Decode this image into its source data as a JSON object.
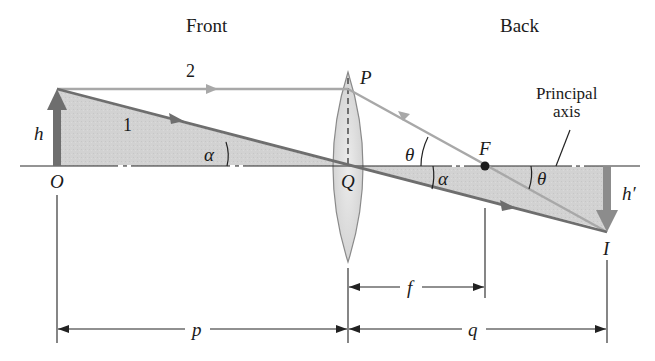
{
  "diagram": {
    "type": "thin converging lens ray diagram",
    "headers": {
      "front": "Front",
      "back": "Back"
    },
    "rays": [
      {
        "id": "1",
        "label": "1",
        "description": "Ray from object tip through lens center Q to image I"
      },
      {
        "id": "2",
        "label": "2",
        "description": "Ray parallel to axis to P, refracted through focal point F to I"
      }
    ],
    "points": {
      "object": "O",
      "lens_top": "P",
      "lens_center": "Q",
      "focal_point": "F",
      "image": "I"
    },
    "heights": {
      "object": "h",
      "image": "h′"
    },
    "angles": {
      "alpha": "α",
      "theta": "θ"
    },
    "annotation": {
      "line1": "Principal",
      "line2": "axis"
    },
    "dimensions": {
      "object_distance": "p",
      "image_distance": "q",
      "focal_length": "f"
    },
    "colors": {
      "shade": "#cfcfcf",
      "ray": "#6e6e6e",
      "ray_light": "#a8a8a8",
      "axis": "#2a2a2a",
      "lens_fill": "#dcdcdc",
      "lens_edge": "#8a8a8a"
    }
  }
}
